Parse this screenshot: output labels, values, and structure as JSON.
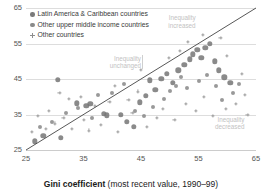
{
  "chart_data": {
    "type": "scatter",
    "title": "",
    "xlabel": "Gini coefficient (most recent value, 1990–99)",
    "xlabel_bold": "Gini coefficient",
    "xlabel_rest": " (most recent value, 1990–99)",
    "ylabel": "",
    "xlim": [
      25,
      65
    ],
    "ylim": [
      25,
      65
    ],
    "xticks": [
      25,
      35,
      45,
      55,
      65
    ],
    "yticks": [
      25,
      35,
      45,
      55,
      65
    ],
    "grid": true,
    "grid_axis": "y",
    "legend_position": "top-left",
    "reference_line": {
      "label": "45-degree line of equality",
      "type": "diagonal",
      "from": [
        25,
        25
      ],
      "to": [
        65,
        65
      ],
      "color": "#444444"
    },
    "annotations": [
      {
        "text": "Inequality\nincreased",
        "x": 54.5,
        "y": 61.5,
        "color": "#c2c2c2"
      },
      {
        "text": "Inequality\nunchanged",
        "x": 45.0,
        "y": 50.0,
        "color": "#c2c2c2"
      },
      {
        "text": "Inequality\ndecreased",
        "x": 63.0,
        "y": 33.0,
        "color": "#c2c2c2"
      }
    ],
    "legend": [
      {
        "label": "Latin America & Caribbean countries",
        "marker": "circle-large",
        "color": "#7a7a7a"
      },
      {
        "label": "Other upper middle income countries",
        "marker": "circle-medium",
        "color": "#8a8a8a"
      },
      {
        "label": "Other countries",
        "marker": "cross-small",
        "color": "#8d8d8d"
      }
    ],
    "series": [
      {
        "name": "Latin America & Caribbean countries",
        "marker": "circle-large",
        "color": "#767676",
        "points": [
          [
            30.5,
            44.8
          ],
          [
            33.8,
            38.2
          ],
          [
            35.5,
            37.5
          ],
          [
            36.2,
            38.0
          ],
          [
            38.5,
            35.2
          ],
          [
            39.0,
            34.8
          ],
          [
            41.5,
            35.0
          ],
          [
            42.5,
            33.0
          ],
          [
            43.8,
            31.5
          ],
          [
            44.8,
            38.4
          ],
          [
            45.8,
            40.2
          ],
          [
            46.5,
            44.6
          ],
          [
            47.5,
            42.0
          ],
          [
            48.5,
            45.0
          ],
          [
            49.5,
            46.5
          ],
          [
            50.5,
            44.0
          ],
          [
            51.5,
            47.5
          ],
          [
            52.5,
            49.0
          ],
          [
            53.5,
            50.5
          ],
          [
            54.0,
            52.0
          ],
          [
            54.8,
            53.2
          ],
          [
            55.5,
            51.0
          ],
          [
            56.2,
            53.8
          ],
          [
            57.0,
            55.0
          ],
          [
            57.8,
            50.0
          ],
          [
            58.5,
            47.5
          ],
          [
            59.5,
            45.5
          ],
          [
            60.5,
            44.0
          ],
          [
            26.5,
            27.5
          ],
          [
            28.0,
            29.0
          ],
          [
            31.0,
            28.5
          ]
        ]
      },
      {
        "name": "Other upper middle income countries",
        "marker": "circle-medium",
        "color": "#878787",
        "points": [
          [
            27.5,
            31.5
          ],
          [
            29.5,
            33.0
          ],
          [
            32.0,
            35.5
          ],
          [
            34.0,
            36.8
          ],
          [
            36.5,
            34.0
          ],
          [
            37.5,
            40.5
          ],
          [
            40.0,
            41.0
          ],
          [
            42.0,
            43.5
          ],
          [
            44.0,
            36.0
          ],
          [
            45.5,
            34.5
          ],
          [
            47.0,
            37.0
          ],
          [
            49.0,
            39.5
          ],
          [
            50.0,
            41.5
          ],
          [
            51.0,
            43.0
          ],
          [
            52.0,
            45.5
          ],
          [
            53.0,
            42.5
          ],
          [
            55.0,
            44.5
          ],
          [
            56.5,
            46.0
          ],
          [
            58.0,
            43.0
          ],
          [
            61.0,
            41.0
          ],
          [
            62.0,
            43.5
          ],
          [
            59.0,
            39.0
          ]
        ]
      },
      {
        "name": "Other countries",
        "marker": "cross-small",
        "color": "#9a9a9a",
        "points": [
          [
            26.0,
            30.0
          ],
          [
            27.0,
            34.5
          ],
          [
            28.5,
            31.0
          ],
          [
            29.0,
            36.0
          ],
          [
            30.0,
            32.5
          ],
          [
            31.5,
            34.0
          ],
          [
            33.0,
            31.0
          ],
          [
            34.5,
            40.0
          ],
          [
            35.0,
            33.5
          ],
          [
            36.0,
            30.5
          ],
          [
            37.0,
            37.5
          ],
          [
            38.0,
            32.0
          ],
          [
            39.5,
            38.5
          ],
          [
            41.0,
            30.0
          ],
          [
            42.8,
            39.0
          ],
          [
            43.5,
            35.5
          ],
          [
            44.5,
            41.5
          ],
          [
            46.0,
            31.5
          ],
          [
            47.8,
            34.0
          ],
          [
            48.8,
            36.5
          ],
          [
            50.8,
            33.5
          ],
          [
            52.8,
            38.0
          ],
          [
            54.5,
            36.0
          ],
          [
            56.0,
            40.0
          ],
          [
            57.5,
            34.5
          ],
          [
            59.8,
            36.5
          ],
          [
            61.5,
            38.0
          ],
          [
            63.0,
            40.5
          ],
          [
            63.5,
            35.0
          ],
          [
            62.5,
            46.5
          ],
          [
            60.0,
            51.5
          ],
          [
            58.8,
            56.5
          ],
          [
            55.8,
            57.5
          ],
          [
            53.2,
            55.5
          ],
          [
            51.8,
            53.0
          ],
          [
            49.8,
            51.0
          ],
          [
            45.0,
            47.5
          ],
          [
            40.5,
            43.0
          ],
          [
            32.5,
            39.5
          ],
          [
            30.8,
            41.0
          ]
        ]
      }
    ]
  },
  "axis": {
    "x_tick_labels": [
      "25",
      "35",
      "45",
      "55",
      "65"
    ],
    "y_tick_labels": [
      "25",
      "35",
      "45",
      "55",
      "65"
    ]
  }
}
